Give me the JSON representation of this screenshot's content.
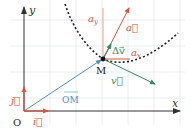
{
  "diagram": {
    "type": "kinematics-vector-diagram",
    "colors": {
      "axis": "#333333",
      "grid": "#e8ecef",
      "position_vector": "#4a90c8",
      "unit_vectors": "#e0503c",
      "acceleration": "#e0503c",
      "acceleration_components": "#e8a090",
      "velocity": "#3a8a5a",
      "delta_v": "#3a8a5a",
      "trajectory": "#222222",
      "point": "#111111"
    },
    "labels": {
      "x_axis": "x",
      "y_axis": "y",
      "origin": "O",
      "point": "M",
      "unit_i": "i⃗",
      "unit_j": "j⃗",
      "position_vector": "OM",
      "acceleration": "a⃗",
      "a_x": "a",
      "a_x_sub": "x",
      "a_y": "a",
      "a_y_sub": "y",
      "delta_v": "Δv⃗",
      "velocity": "v⃗"
    }
  }
}
